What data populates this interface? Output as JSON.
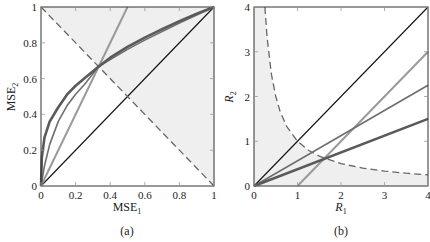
{
  "chart_data": [
    {
      "type": "line",
      "panel_label": "(a)",
      "xlabel": "MSE",
      "xlabel_sub": "1",
      "ylabel": "MSE",
      "ylabel_sub": "2",
      "xlim": [
        0,
        1
      ],
      "ylim": [
        0,
        1
      ],
      "xticks": [
        0,
        0.2,
        0.4,
        0.6,
        0.8,
        1
      ],
      "xtick_labels": [
        "0",
        "0.2",
        "0.4",
        "0.6",
        "0.8",
        "1"
      ],
      "yticks": [
        0,
        0.2,
        0.4,
        0.6,
        0.8,
        1
      ],
      "ytick_labels": [
        "0",
        "0.2",
        "0.4",
        "0.6",
        "0.8",
        "1"
      ],
      "grid": false,
      "shaded_region": "MSE1 + MSE2 >= 1 (above dashed line)",
      "series": [
        {
          "name": "diagonal",
          "style": "solid-thin-black",
          "color": "#111111",
          "x": [
            0,
            1
          ],
          "y": [
            0,
            1
          ]
        },
        {
          "name": "boundary-dashed",
          "style": "dashed",
          "color": "#666666",
          "x": [
            0,
            1
          ],
          "y": [
            1,
            0
          ]
        },
        {
          "name": "steep-line",
          "style": "solid-light",
          "color": "#9a9a9a",
          "x": [
            0,
            0.5
          ],
          "y": [
            0,
            1
          ]
        },
        {
          "name": "curve-medium",
          "style": "solid-medium",
          "color": "#6e6e6e",
          "x": [
            0,
            0.02,
            0.05,
            0.1,
            0.15,
            0.2,
            0.25,
            0.333,
            0.4,
            0.5,
            0.6,
            0.7,
            0.8,
            0.9,
            1
          ],
          "y": [
            0,
            0.112,
            0.231,
            0.361,
            0.448,
            0.513,
            0.566,
            0.667,
            0.706,
            0.763,
            0.815,
            0.863,
            0.911,
            0.955,
            1
          ]
        },
        {
          "name": "curve-thick",
          "style": "solid-thick",
          "color": "#5a5a5a",
          "x": [
            0,
            0.005,
            0.02,
            0.05,
            0.1,
            0.15,
            0.2,
            0.25,
            0.333,
            0.4,
            0.5,
            0.6,
            0.7,
            0.8,
            0.9,
            1
          ],
          "y": [
            0,
            0.16,
            0.27,
            0.36,
            0.44,
            0.51,
            0.56,
            0.6,
            0.667,
            0.717,
            0.777,
            0.829,
            0.876,
            0.921,
            0.962,
            1
          ]
        }
      ]
    },
    {
      "type": "line",
      "panel_label": "(b)",
      "xlabel": "R",
      "xlabel_sub": "1",
      "ylabel": "R",
      "ylabel_sub": "2",
      "xlim": [
        0,
        4
      ],
      "ylim": [
        0,
        4
      ],
      "xticks": [
        0,
        1,
        2,
        3,
        4
      ],
      "xtick_labels": [
        "0",
        "1",
        "2",
        "3",
        "4"
      ],
      "yticks": [
        0,
        1,
        2,
        3,
        4
      ],
      "ytick_labels": [
        "0",
        "1",
        "2",
        "3",
        "4"
      ],
      "grid": false,
      "shaded_region": "R2 <= 1/R1 (below dashed curve)",
      "series": [
        {
          "name": "diagonal",
          "style": "solid-thin-black",
          "color": "#111111",
          "x": [
            0,
            4
          ],
          "y": [
            0,
            4
          ]
        },
        {
          "name": "boundary-dashed",
          "style": "dashed",
          "color": "#666666",
          "x": [
            0.25,
            0.3,
            0.4,
            0.5,
            0.6,
            0.75,
            1,
            1.25,
            1.5,
            2,
            2.5,
            3,
            3.5,
            4
          ],
          "y": [
            4,
            3.333,
            2.5,
            2,
            1.667,
            1.333,
            1,
            0.8,
            0.667,
            0.5,
            0.4,
            0.333,
            0.286,
            0.25
          ]
        },
        {
          "name": "line-light",
          "style": "solid-light",
          "color": "#9a9a9a",
          "x": [
            1,
            4
          ],
          "y": [
            0,
            3
          ]
        },
        {
          "name": "line-medium",
          "style": "solid-medium",
          "color": "#6e6e6e",
          "x": [
            0,
            4
          ],
          "y": [
            0,
            2.25
          ]
        },
        {
          "name": "line-thick",
          "style": "solid-thick",
          "color": "#5a5a5a",
          "x": [
            0,
            4
          ],
          "y": [
            0,
            1.5
          ]
        }
      ]
    }
  ],
  "colors": {
    "shade": "#efefef",
    "axis": "#333333"
  }
}
